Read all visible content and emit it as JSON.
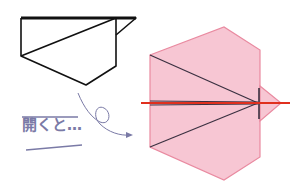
{
  "caption": {
    "ruby": "ひら",
    "text": "開くと…"
  },
  "colors": {
    "outline": "#111111",
    "fill_pink": "#f7c6d3",
    "edge_pink": "#e98aa0",
    "red_line": "#e0301e",
    "fold_line": "#3a3040",
    "label": "#7a7aa6",
    "arrow": "#7a7aa6"
  },
  "figures": [
    {
      "name": "folded-shape",
      "description": "Folded paper outline (before)"
    },
    {
      "name": "unfolded-shape",
      "description": "Unfolded pink hexagon with crease lines and red center line (after)"
    }
  ]
}
